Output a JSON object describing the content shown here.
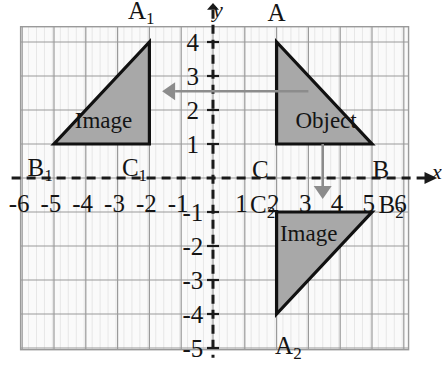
{
  "figure": {
    "type": "coordinate-grid-geometry",
    "title": "",
    "axis_labels": {
      "x": "x",
      "y": "y"
    },
    "x_axis": {
      "min": -6.2,
      "max": 6.2,
      "ticks": [
        -6,
        -5,
        -4,
        -3,
        -2,
        -1,
        1,
        2,
        3,
        4,
        5,
        6
      ],
      "tick_labels": [
        "-6",
        "-5",
        "-4",
        "-3",
        "-2",
        "-1",
        "1",
        "2",
        "3",
        "4",
        "5",
        "6"
      ]
    },
    "y_axis": {
      "min": -5,
      "max": 4.4,
      "ticks": [
        4,
        3,
        2,
        1,
        -1,
        -2,
        -3,
        -4,
        -5
      ],
      "tick_labels": [
        "4",
        "3",
        "2",
        "1",
        "-1",
        "-2",
        "-3",
        "-4",
        "-5"
      ]
    },
    "grid": {
      "shown": true,
      "major_color": "#9a9a9a",
      "minor_color": "#e2e2e2",
      "cell_fill": "#fafafa"
    },
    "axis_style": {
      "color": "#1a1a1a",
      "dashed": true
    }
  },
  "chart_data": {
    "type": "scatter",
    "title": "",
    "xlabel": "x",
    "ylabel": "y",
    "xlim": [
      -6.2,
      6.2
    ],
    "ylim": [
      -5,
      4.4
    ],
    "grid": true,
    "shapes": [
      {
        "name": "Object",
        "label": "Object",
        "fill": "#a8a8a8",
        "stroke": "#111111",
        "vertices": [
          {
            "label": "A",
            "x": 2,
            "y": 4
          },
          {
            "label": "C",
            "x": 2,
            "y": 1
          },
          {
            "label": "B",
            "x": 5,
            "y": 1
          }
        ]
      },
      {
        "name": "Image1",
        "label": "Image",
        "fill": "#a8a8a8",
        "stroke": "#111111",
        "vertices": [
          {
            "label": "A1",
            "x": -2,
            "y": 4
          },
          {
            "label": "C1",
            "x": -2,
            "y": 1
          },
          {
            "label": "B1",
            "x": -5,
            "y": 1
          }
        ]
      },
      {
        "name": "Image2",
        "label": "Image",
        "fill": "#a8a8a8",
        "stroke": "#111111",
        "vertices": [
          {
            "label": "A2",
            "x": 2,
            "y": -4
          },
          {
            "label": "C2",
            "x": 2,
            "y": -1
          },
          {
            "label": "B2",
            "x": 5,
            "y": -1
          }
        ]
      }
    ],
    "arrows": [
      {
        "name": "reflection-horizontal-arrow",
        "from": {
          "x": 3.0,
          "y": 2.55
        },
        "to": {
          "x": -1.6,
          "y": 2.55
        },
        "color": "#8c8c8c"
      },
      {
        "name": "reflection-vertical-arrow",
        "from": {
          "x": 3.45,
          "y": 1.0
        },
        "to": {
          "x": 3.45,
          "y": -0.62
        },
        "color": "#8c8c8c"
      }
    ],
    "point_labels": [
      {
        "id": "A",
        "base": "A",
        "sub": "",
        "x": 2,
        "y": 4,
        "dx": 0,
        "dy": 30,
        "anchor": "middle"
      },
      {
        "id": "A1",
        "base": "A",
        "sub": "1",
        "x": -2,
        "y": 4,
        "dx": -8,
        "dy": 30,
        "anchor": "middle"
      },
      {
        "id": "A2",
        "base": "A",
        "sub": "2",
        "x": 2,
        "y": -4,
        "dx": 12,
        "dy": -33,
        "anchor": "middle"
      },
      {
        "id": "B",
        "base": "B",
        "sub": "",
        "x": 5,
        "y": 1,
        "dx": 9,
        "dy": -25,
        "anchor": "middle"
      },
      {
        "id": "C",
        "base": "C",
        "sub": "",
        "x": 2,
        "y": 1,
        "dx": -16,
        "dy": -25,
        "anchor": "middle"
      },
      {
        "id": "B1",
        "base": "B",
        "sub": "1",
        "x": -5,
        "y": 1,
        "dx": -14,
        "dy": -25,
        "anchor": "middle"
      },
      {
        "id": "C1",
        "base": "C",
        "sub": "1",
        "x": -2,
        "y": 1,
        "dx": -15,
        "dy": -25,
        "anchor": "middle"
      },
      {
        "id": "B2",
        "base": "B",
        "sub": "2",
        "x": 5,
        "y": 0,
        "dx": 19,
        "dy": -28,
        "anchor": "middle"
      },
      {
        "id": "C2",
        "base": "C",
        "sub": "2",
        "x": 2,
        "y": 0,
        "dx": -14,
        "dy": -28,
        "anchor": "middle"
      }
    ]
  }
}
